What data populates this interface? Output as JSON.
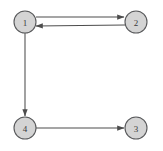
{
  "figure": {
    "name": "directed-graph",
    "background_color": "#ffffff",
    "width": 163,
    "height": 151
  },
  "style": {
    "node_fill": "#d4d4d4",
    "node_stroke": "#58595b",
    "node_radius": 11,
    "label_color": "#3a3a3a",
    "edge_color": "#4d4d4d"
  },
  "graph": {
    "directed": true,
    "nodes": [
      {
        "id": "1",
        "label": "1",
        "cx": 25,
        "cy": 22
      },
      {
        "id": "2",
        "label": "2",
        "cx": 136,
        "cy": 22
      },
      {
        "id": "3",
        "label": "3",
        "cx": 136,
        "cy": 128
      },
      {
        "id": "4",
        "label": "4",
        "cx": 25,
        "cy": 128
      }
    ],
    "edges": [
      {
        "id": "1-2",
        "from": "1",
        "to": "2",
        "label": "",
        "x1": 36,
        "y1": 17,
        "x2": 124,
        "y2": 17
      },
      {
        "id": "2-1",
        "from": "2",
        "to": "1",
        "label": "",
        "x1": 125,
        "y1": 25,
        "x2": 36,
        "y2": 26
      },
      {
        "id": "1-4",
        "from": "1",
        "to": "4",
        "label": "",
        "x1": 25,
        "y1": 33,
        "x2": 25,
        "y2": 116
      },
      {
        "id": "4-3",
        "from": "4",
        "to": "3",
        "label": "",
        "x1": 36,
        "y1": 128,
        "x2": 124,
        "y2": 128
      }
    ]
  }
}
